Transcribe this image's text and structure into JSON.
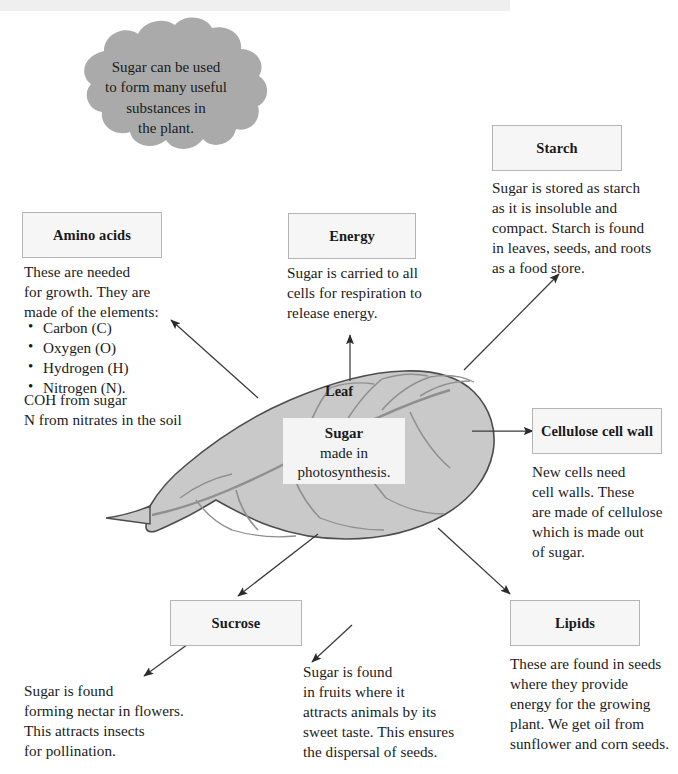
{
  "diagram": {
    "title_hidden": "Uses of sugar made in photosynthesis",
    "scan_bar_color": "#efefef",
    "cloud_fill": "#aaaaaa",
    "leaf_fill": "#c9c9c9",
    "leaf_stroke": "#4d4d4d",
    "box_fill": "#f6f6f6",
    "box_stroke": "#b4b4b4",
    "arrow_color": "#3a3a3a"
  },
  "cloud": {
    "text": "Sugar can be used\nto form many useful\nsubstances in\nthe plant."
  },
  "leaf": {
    "label": "Leaf",
    "core": {
      "line1": "Sugar",
      "line2": "made in",
      "line3": "photosynthesis."
    }
  },
  "nodes": [
    {
      "id": "amino-acids",
      "title": "Amino acids",
      "body": "These are needed\nfor growth. They are\nmade of the elements:",
      "bullets": [
        "Carbon (C)",
        "Oxygen (O)",
        "Hydrogen (H)",
        "Nitrogen (N)."
      ],
      "note": "COH from sugar\nN from nitrates in the soil"
    },
    {
      "id": "energy",
      "title": "Energy",
      "body": "Sugar is carried to all\ncells for respiration to\nrelease energy."
    },
    {
      "id": "starch",
      "title": "Starch",
      "body": "Sugar is stored as starch\nas it is insoluble and\ncompact. Starch is found\nin leaves, seeds, and roots\nas a food store."
    },
    {
      "id": "cellulose-cell-wall",
      "title": "Cellulose cell\nwall",
      "body": "New cells need\ncell walls. These\nare made of cellulose\nwhich is made out\nof sugar."
    },
    {
      "id": "lipids",
      "title": "Lipids",
      "body": "These are found in seeds\nwhere they provide\nenergy for the growing\nplant. We get oil from\nsunflower and corn seeds."
    },
    {
      "id": "sucrose",
      "title": "Sucrose",
      "body_left": "Sugar is found\nforming nectar in flowers.\nThis attracts insects\nfor pollination.",
      "body_right": "Sugar is found\nin fruits where it\nattracts animals by its\nsweet taste. This ensures\nthe dispersal of seeds."
    }
  ]
}
